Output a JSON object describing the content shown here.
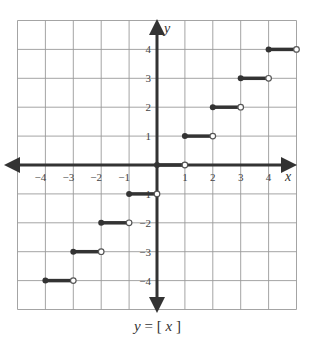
{
  "chart_data": {
    "type": "line",
    "caption": {
      "lhs": "y",
      "eq": "=",
      "open": "[",
      "var": "x",
      "close": "]"
    },
    "xlabel": "x",
    "ylabel": "y",
    "xlim": [
      -5,
      5
    ],
    "ylim": [
      -5,
      5
    ],
    "grid": true,
    "xticks": [
      -4,
      -3,
      -2,
      -1,
      1,
      2,
      3,
      4
    ],
    "yticks": [
      4,
      3,
      2,
      1,
      -1,
      -2,
      -3,
      -4
    ],
    "xtick_labels": [
      "−4",
      "−3",
      "−2",
      "−1",
      "1",
      "2",
      "3",
      "4"
    ],
    "ytick_labels": [
      "4",
      "3",
      "2",
      "1",
      "−1",
      "−2",
      "−3",
      "−4"
    ],
    "series": [
      {
        "name": "floor(x)",
        "segments": [
          {
            "x0": -4,
            "x1": -3,
            "y": -4,
            "start": "closed",
            "end": "open"
          },
          {
            "x0": -3,
            "x1": -2,
            "y": -3,
            "start": "closed",
            "end": "open"
          },
          {
            "x0": -2,
            "x1": -1,
            "y": -2,
            "start": "closed",
            "end": "open"
          },
          {
            "x0": -1,
            "x1": 0,
            "y": -1,
            "start": "closed",
            "end": "open"
          },
          {
            "x0": 0,
            "x1": 1,
            "y": 0,
            "start": "closed",
            "end": "open"
          },
          {
            "x0": 1,
            "x1": 2,
            "y": 1,
            "start": "closed",
            "end": "open"
          },
          {
            "x0": 2,
            "x1": 3,
            "y": 2,
            "start": "closed",
            "end": "open"
          },
          {
            "x0": 3,
            "x1": 4,
            "y": 3,
            "start": "closed",
            "end": "open"
          },
          {
            "x0": 4,
            "x1": 5,
            "y": 4,
            "start": "closed",
            "end": "open"
          }
        ]
      }
    ],
    "colors": {
      "axis": "#333333",
      "grid": "#9a9a9a",
      "line": "#333333"
    }
  }
}
